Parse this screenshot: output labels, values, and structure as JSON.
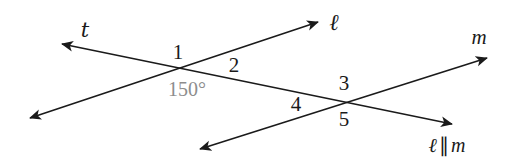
{
  "figure": {
    "type": "geometry-diagram",
    "canvas": {
      "width": 511,
      "height": 167,
      "background": "#ffffff"
    },
    "stroke_color": "#1a1a1a",
    "stroke_width": 1.6,
    "lines": [
      {
        "id": "line-t",
        "name": "t",
        "role": "transversal",
        "x1": 62,
        "y1": 44,
        "x2": 452,
        "y2": 124,
        "arrow_start": true,
        "arrow_end": true
      },
      {
        "id": "line-ell",
        "name": "ℓ",
        "role": "parallel-line-1",
        "x1": 30,
        "y1": 118,
        "x2": 318,
        "y2": 22,
        "arrow_start": true,
        "arrow_end": true
      },
      {
        "id": "line-m",
        "name": "m",
        "role": "parallel-line-2",
        "x1": 200,
        "y1": 149,
        "x2": 487,
        "y2": 58,
        "arrow_start": true,
        "arrow_end": true
      }
    ],
    "intersections": [
      {
        "id": "intersection-1",
        "lines": [
          "t",
          "ℓ"
        ],
        "x": 181,
        "y": 69
      },
      {
        "id": "intersection-2",
        "lines": [
          "t",
          "m"
        ],
        "x": 343,
        "y": 102
      }
    ],
    "labels": {
      "line_t": {
        "text": "t",
        "x": 85,
        "y": 30
      },
      "line_ell": {
        "text": "ℓ",
        "x": 334,
        "y": 22
      },
      "line_m": {
        "text": "m",
        "x": 479,
        "y": 37
      },
      "angle_1": {
        "text": "1",
        "x": 178,
        "y": 52
      },
      "angle_2": {
        "text": "2",
        "x": 234,
        "y": 65
      },
      "angle_150": {
        "text": "150°",
        "x": 187,
        "y": 89,
        "color": "#8d8d8d"
      },
      "angle_3": {
        "text": "3",
        "x": 344,
        "y": 83
      },
      "angle_4": {
        "text": "4",
        "x": 296,
        "y": 104
      },
      "angle_5": {
        "text": "5",
        "x": 344,
        "y": 119
      },
      "parallel_note": {
        "ell": "ℓ",
        "symbol": "∥",
        "m": "m",
        "x": 447,
        "y": 145
      }
    }
  }
}
